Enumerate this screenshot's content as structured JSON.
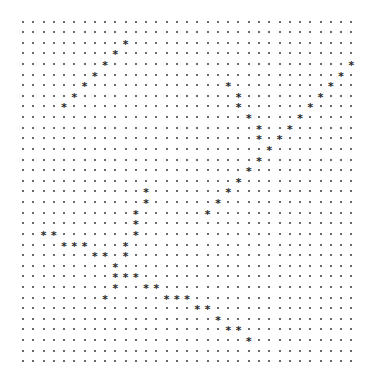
{
  "grid": {
    "columns": 33,
    "rows": 33,
    "empty_symbol": ".",
    "mark_symbol": "*",
    "mark_icon": "asterisk-icon",
    "empty_icon": "dot-icon",
    "marked_cells": [
      {
        "row": 2,
        "cols": [
          10
        ]
      },
      {
        "row": 3,
        "cols": [
          9
        ]
      },
      {
        "row": 4,
        "cols": [
          8,
          32
        ]
      },
      {
        "row": 5,
        "cols": [
          7,
          31
        ]
      },
      {
        "row": 6,
        "cols": [
          6,
          20,
          30
        ]
      },
      {
        "row": 7,
        "cols": [
          5,
          21,
          29
        ]
      },
      {
        "row": 8,
        "cols": [
          4,
          21,
          28
        ]
      },
      {
        "row": 9,
        "cols": [
          22,
          27
        ]
      },
      {
        "row": 10,
        "cols": [
          23,
          26
        ]
      },
      {
        "row": 11,
        "cols": [
          23,
          25
        ]
      },
      {
        "row": 12,
        "cols": [
          24
        ]
      },
      {
        "row": 13,
        "cols": [
          23
        ]
      },
      {
        "row": 14,
        "cols": [
          22
        ]
      },
      {
        "row": 15,
        "cols": [
          21
        ]
      },
      {
        "row": 16,
        "cols": [
          12,
          20
        ]
      },
      {
        "row": 17,
        "cols": [
          12,
          19
        ]
      },
      {
        "row": 18,
        "cols": [
          11,
          18
        ]
      },
      {
        "row": 19,
        "cols": [
          11
        ]
      },
      {
        "row": 20,
        "cols": [
          2,
          3,
          11
        ]
      },
      {
        "row": 21,
        "cols": [
          4,
          5,
          6,
          10
        ]
      },
      {
        "row": 22,
        "cols": [
          7,
          8,
          10
        ]
      },
      {
        "row": 23,
        "cols": [
          9
        ]
      },
      {
        "row": 24,
        "cols": [
          9,
          10,
          11
        ]
      },
      {
        "row": 25,
        "cols": [
          9,
          12,
          13
        ]
      },
      {
        "row": 26,
        "cols": [
          8,
          14,
          15,
          16
        ]
      },
      {
        "row": 27,
        "cols": [
          17,
          18
        ]
      },
      {
        "row": 28,
        "cols": [
          19
        ]
      },
      {
        "row": 29,
        "cols": [
          20,
          21
        ]
      },
      {
        "row": 30,
        "cols": [
          22
        ]
      }
    ]
  }
}
